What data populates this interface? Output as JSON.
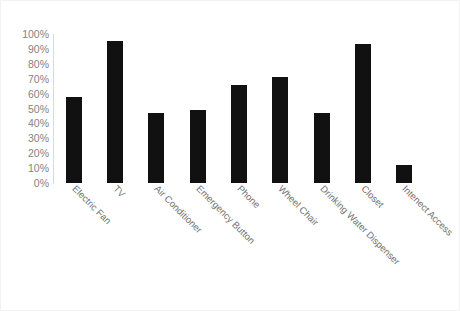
{
  "chart_data": {
    "type": "bar",
    "title": "",
    "subtitle": "",
    "xlabel": "",
    "ylabel": "",
    "categories": [
      "Electric Fan",
      "TV",
      "Air Conditioner",
      "Emergency Button",
      "Phone",
      "Wheel Chair",
      "Drinking Water Dispenser",
      "Closet",
      "Intenect Access"
    ],
    "values": [
      58,
      95,
      47,
      49,
      66,
      71,
      47,
      93,
      12
    ],
    "value_suffix": "%",
    "ylim": [
      0,
      100
    ],
    "ytick_step": 10,
    "ytick_labels": [
      "0%",
      "10%",
      "20%",
      "30%",
      "40%",
      "50%",
      "60%",
      "70%",
      "80%",
      "90%",
      "100%"
    ],
    "grid": false,
    "legend": false,
    "legend_position": "none",
    "bar_color": "#111111",
    "axis_color": "#d9d9d9",
    "tick_label_color": "#838383",
    "category_label_color": "#6f6f6f",
    "background_color": "#ffffff",
    "border_color": "#f2f2f2",
    "label_rotation_degrees": 45
  }
}
